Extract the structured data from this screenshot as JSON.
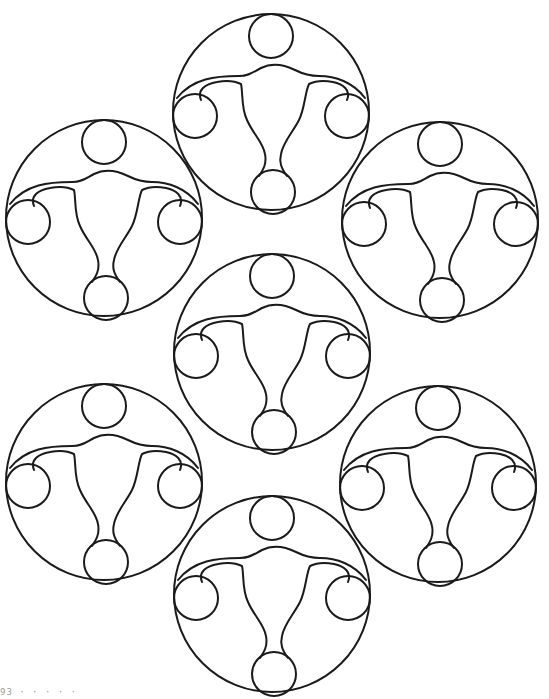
{
  "page": {
    "type": "coloring-page",
    "background": "#ffffff",
    "line_color": "#1a1a1a"
  },
  "motif": {
    "name": "uterus-in-circle",
    "outer_radius": 98,
    "small_circle_radius": 22,
    "small_circles": [
      {
        "name": "top",
        "cx": 0,
        "cy": -76
      },
      {
        "name": "left",
        "cx": -76,
        "cy": 4
      },
      {
        "name": "right",
        "cx": 76,
        "cy": 4
      },
      {
        "name": "bottom",
        "cx": 2,
        "cy": 80
      }
    ]
  },
  "medallions": [
    {
      "name": "top",
      "cx": 271,
      "cy": 112
    },
    {
      "name": "upper-left",
      "cx": 104,
      "cy": 218
    },
    {
      "name": "upper-right",
      "cx": 440,
      "cy": 220
    },
    {
      "name": "center",
      "cx": 272,
      "cy": 352
    },
    {
      "name": "lower-left",
      "cx": 104,
      "cy": 482
    },
    {
      "name": "lower-right",
      "cx": 438,
      "cy": 484
    },
    {
      "name": "bottom",
      "cx": 272,
      "cy": 594
    }
  ],
  "caption": "93 · · · · ·"
}
